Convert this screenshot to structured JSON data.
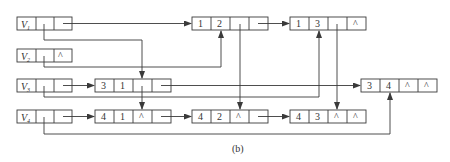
{
  "caption": "(b)",
  "colors": {
    "line": "#3a3a3a",
    "background": "#ffffff"
  },
  "vertices": [
    {
      "label": "V",
      "sub": "1",
      "first_out": "",
      "first_in": ""
    },
    {
      "label": "V",
      "sub": "2",
      "first_out": "",
      "first_in": "^"
    },
    {
      "label": "V",
      "sub": "3",
      "first_out": "",
      "first_in": ""
    },
    {
      "label": "V",
      "sub": "4",
      "first_out": "",
      "first_in": ""
    }
  ],
  "arcs": [
    {
      "id": "a12",
      "tail": "1",
      "head": "2",
      "hlink": "",
      "tlink": ""
    },
    {
      "id": "a13",
      "tail": "1",
      "head": "3",
      "hlink": "",
      "tlink": "^"
    },
    {
      "id": "a31",
      "tail": "3",
      "head": "1",
      "hlink": "",
      "tlink": ""
    },
    {
      "id": "a34",
      "tail": "3",
      "head": "4",
      "hlink": "^",
      "tlink": "^"
    },
    {
      "id": "a41",
      "tail": "4",
      "head": "1",
      "hlink": "^",
      "tlink": ""
    },
    {
      "id": "a42",
      "tail": "4",
      "head": "2",
      "hlink": "^",
      "tlink": ""
    },
    {
      "id": "a43",
      "tail": "4",
      "head": "3",
      "hlink": "^",
      "tlink": "^"
    }
  ]
}
